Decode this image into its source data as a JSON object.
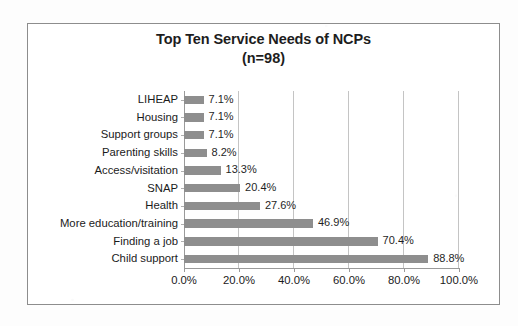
{
  "chart_data": {
    "type": "bar",
    "orientation": "horizontal",
    "title": "Top Ten Service Needs of NCPs",
    "subtitle": "(n=98)",
    "xlabel": "",
    "ylabel": "",
    "categories": [
      "LIHEAP",
      "Housing",
      "Support groups",
      "Parenting skills",
      "Access/visitation",
      "SNAP",
      "Health",
      "More education/training",
      "Finding a job",
      "Child support"
    ],
    "values": [
      7.1,
      7.1,
      7.1,
      8.2,
      13.3,
      20.4,
      27.6,
      46.9,
      70.4,
      88.8
    ],
    "data_labels": [
      "7.1%",
      "7.1%",
      "7.1%",
      "8.2%",
      "13.3%",
      "20.4%",
      "27.6%",
      "46.9%",
      "70.4%",
      "88.8%"
    ],
    "xlim": [
      0,
      100
    ],
    "x_tick_labels": [
      "0.0%",
      "20.0%",
      "40.0%",
      "60.0%",
      "80.0%",
      "100.0%"
    ],
    "x_tick_values": [
      0,
      20,
      40,
      60,
      80,
      100
    ],
    "grid": true,
    "grid_axis": "x",
    "legend": false,
    "bar_color": "#8e8e8e",
    "text_color": "#1b1b1b",
    "gridline_color": "#c4c4c4",
    "axis_color": "#9a9a9a",
    "frame_color": "#8d8d8d",
    "background_color": "#ffffff"
  }
}
